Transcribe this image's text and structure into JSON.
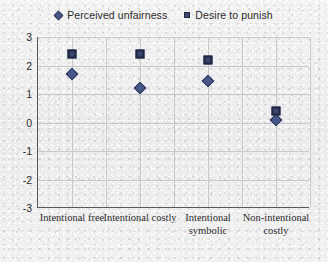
{
  "chart_data": {
    "type": "scatter",
    "title": "",
    "xlabel": "",
    "ylabel": "",
    "ylim": [
      -3,
      3
    ],
    "grid": true,
    "legend_position": "top-center",
    "categories": [
      "Intentional free",
      "Intentional costly",
      "Intentional symbolic",
      "Non-intentional costly"
    ],
    "yticks": [
      "3",
      "2",
      "1",
      "0",
      "-1",
      "-2",
      "-3"
    ],
    "ytick_values": [
      3,
      2,
      1,
      0,
      -1,
      -2,
      -3
    ],
    "series": [
      {
        "name": "Perceived unfairness",
        "marker": "diamond",
        "color": "#47578a",
        "values": [
          1.7,
          1.2,
          1.45,
          0.1
        ]
      },
      {
        "name": "Desire to punish",
        "marker": "square",
        "color": "#39476e",
        "values": [
          2.4,
          2.4,
          2.2,
          0.4
        ]
      }
    ]
  },
  "legend": {
    "items": [
      {
        "label": "Perceived unfairness",
        "marker": "diamond-marker"
      },
      {
        "label": "Desire to punish",
        "marker": "square-marker"
      }
    ]
  },
  "axis": {
    "y_labels": [
      "3",
      "2",
      "1",
      "0",
      "-1",
      "-2",
      "-3"
    ],
    "x_labels": [
      "Intentional free",
      "Intentional costly",
      "Intentional symbolic",
      "Non-intentional costly"
    ]
  }
}
